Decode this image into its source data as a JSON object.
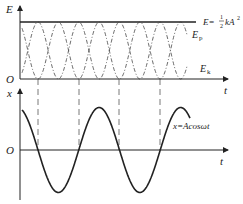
{
  "top_graph": {
    "y_axis_label": "E",
    "x_axis_label": "t",
    "origin_label": "O",
    "total_energy_label": "E = ½kA²",
    "total_energy_prefix": "E=",
    "total_energy_frac_num": "1",
    "total_energy_frac_den": "2",
    "total_energy_suffix": "kA",
    "total_energy_exp": "2",
    "potential_label": "E",
    "potential_sub": "p",
    "kinetic_label": "E",
    "kinetic_sub": "k"
  },
  "bottom_graph": {
    "y_axis_label": "x",
    "x_axis_label": "t",
    "origin_label": "O",
    "curve_label": "x=Acosωt"
  },
  "colors": {
    "line": "#222222",
    "dashed": "#555555"
  }
}
